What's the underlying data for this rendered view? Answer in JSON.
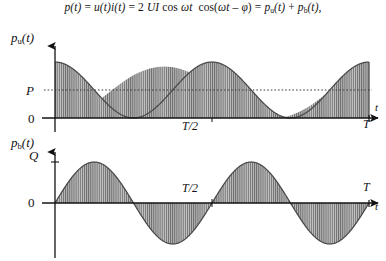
{
  "equation": {
    "full_text": "p(t) = u(t)i(t) = 2 UI cos ωt cos(ωt – φ) = pᵤ(t) + pᵇ(t),",
    "parts": {
      "p_of_t": "p(t)",
      "eq1": "=",
      "u_i": "u(t)i(t)",
      "eq2": "=",
      "two": "2",
      "UI": "UI",
      "cos1": "cos",
      "omega_t": "ωt",
      "cos2": "cos(",
      "omega_t2": "ωt",
      "minus": "–",
      "phi": "φ",
      "close": ")",
      "eq3": "=",
      "p_u": "p",
      "sub_u": "u",
      "p_u_arg": "(t)",
      "plus": "+",
      "p_b": "p",
      "sub_b": "b",
      "p_b_arg": "(t),"
    }
  },
  "charts": {
    "upper": {
      "y_axis_label_base": "p",
      "y_axis_label_sub": "u",
      "y_axis_label_arg": "(t)",
      "x_axis_label": "t",
      "mean_label": "P",
      "zero_label": "0",
      "half_period_label": "T/2",
      "period_label": "T"
    },
    "lower": {
      "y_axis_label_base": "p",
      "y_axis_label_sub": "b",
      "y_axis_label_arg": "(t)",
      "x_axis_label": "t",
      "amplitude_label": "Q",
      "zero_label": "0",
      "half_period_label": "T/2",
      "period_label": "T"
    }
  },
  "chart_data": [
    {
      "type": "line",
      "name": "active-power-waveform",
      "title": "",
      "xlabel": "t",
      "ylabel": "p_u(t)",
      "xlim": [
        0,
        1
      ],
      "ylim": [
        0,
        2
      ],
      "xticks": [
        0.5,
        1
      ],
      "xticklabels": [
        "T/2",
        "T"
      ],
      "yticks": [
        0,
        1
      ],
      "yticklabels": [
        "0",
        "P"
      ],
      "grid": false,
      "legend": false,
      "annotations": [
        "P",
        "0",
        "T/2",
        "T",
        "t",
        "p_u(t)"
      ],
      "description": "Raised cosine p_u(t) = P(1 + cos 2ωt); two full periods over 0..T; area under curve shaded with vertical hatching; dashed horizontal reference line at the mean value P.",
      "formula": "p_u = P*(1 + cos(4*pi*x))",
      "mean_line": 1,
      "mean_line_style": "dashed",
      "fill": "vertical-hatch",
      "x": [
        0,
        0.05,
        0.1,
        0.15,
        0.2,
        0.25,
        0.3,
        0.35,
        0.4,
        0.45,
        0.5,
        0.55,
        0.6,
        0.65,
        0.7,
        0.75,
        0.8,
        0.85,
        0.9,
        0.95,
        1.0
      ],
      "values": [
        2.0,
        1.809,
        1.309,
        0.691,
        0.191,
        0.0,
        0.191,
        0.691,
        1.309,
        1.809,
        2.0,
        1.809,
        1.309,
        0.691,
        0.191,
        0.0,
        0.191,
        0.691,
        1.309,
        1.809,
        2.0
      ]
    },
    {
      "type": "line",
      "name": "reactive-power-waveform",
      "title": "",
      "xlabel": "t",
      "ylabel": "p_b(t)",
      "xlim": [
        0,
        1
      ],
      "ylim": [
        -1,
        1
      ],
      "xticks": [
        0.5,
        1
      ],
      "xticklabels": [
        "T/2",
        "T"
      ],
      "yticks": [
        0,
        1
      ],
      "yticklabels": [
        "0",
        "Q"
      ],
      "grid": false,
      "legend": false,
      "annotations": [
        "Q",
        "0",
        "T/2",
        "T",
        "t",
        "p_b(t)"
      ],
      "description": "Sine wave p_b(t) = Q sin 2ωt; two full periods over 0..T; both positive and negative half-cycles shaded with vertical hatching down/up to the zero axis.",
      "formula": "p_b = Q*sin(4*pi*x)",
      "fill": "vertical-hatch",
      "x": [
        0,
        0.05,
        0.1,
        0.125,
        0.15,
        0.2,
        0.25,
        0.3,
        0.35,
        0.375,
        0.4,
        0.45,
        0.5,
        0.55,
        0.6,
        0.625,
        0.65,
        0.7,
        0.75,
        0.8,
        0.85,
        0.875,
        0.9,
        0.95,
        1.0
      ],
      "values": [
        0.0,
        0.588,
        0.951,
        1.0,
        0.951,
        0.588,
        0.0,
        -0.588,
        -0.951,
        -1.0,
        -0.951,
        -0.588,
        0.0,
        0.588,
        0.951,
        1.0,
        0.951,
        0.588,
        0.0,
        -0.588,
        -0.951,
        -1.0,
        -0.951,
        -0.588,
        0.0
      ]
    }
  ],
  "colors": {
    "ink": "#131313",
    "hatch": "#6e6e6e",
    "fill_tone": "#a9a9a9",
    "background": "#ffffff"
  }
}
